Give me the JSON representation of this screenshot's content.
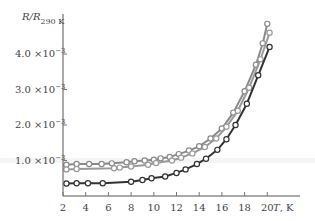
{
  "chart_data": {
    "type": "line",
    "title": "",
    "xlabel": "T, K",
    "ylabel": "R/R290 K",
    "ylabel_main": "R/R",
    "ylabel_sub": "290 K",
    "xlabel_italic": "T",
    "xlabel_unit": ", K",
    "x_ticks": [
      "2",
      "4",
      "6",
      "8",
      "10",
      "12",
      "14",
      "16",
      "18",
      "20"
    ],
    "y_ticks": [
      {
        "value": 1.0,
        "mant": "1.0 ×10",
        "exp": "−3"
      },
      {
        "value": 2.0,
        "mant": "2.0 ×10",
        "exp": "−3"
      },
      {
        "value": 3.0,
        "mant": "3.0 ×10",
        "exp": "−3"
      },
      {
        "value": 4.0,
        "mant": "4.0 ×10",
        "exp": "−3"
      }
    ],
    "xlim": [
      2,
      21
    ],
    "ylim": [
      0,
      5.0
    ],
    "y_scale_note": "values in units of 1e-3",
    "grid": false,
    "series": [
      {
        "name": "sample-1",
        "color": "#8a8a8a",
        "x": [
          2.3,
          3.2,
          4.3,
          5.4,
          6.3,
          7.6,
          8.3,
          9.2,
          10.0,
          10.6,
          11.4,
          12.2,
          13.1,
          14.0,
          15.0,
          16.0,
          17.0,
          18.0,
          19.0,
          19.6,
          20.0
        ],
        "y": [
          0.88,
          0.9,
          0.9,
          0.9,
          0.92,
          0.95,
          0.98,
          1.0,
          1.02,
          1.06,
          1.1,
          1.18,
          1.28,
          1.4,
          1.62,
          1.9,
          2.35,
          2.95,
          3.7,
          4.3,
          4.85
        ]
      },
      {
        "name": "sample-2",
        "color": "#9a9a9a",
        "x": [
          2.3,
          3.2,
          6.5,
          7.0,
          8.0,
          9.5,
          10.2,
          11.6,
          12.4,
          13.4,
          14.5,
          15.5,
          16.4,
          17.4,
          18.4,
          19.4,
          20.2
        ],
        "y": [
          0.75,
          0.76,
          0.78,
          0.8,
          0.83,
          0.88,
          0.93,
          1.0,
          1.08,
          1.2,
          1.38,
          1.62,
          1.95,
          2.4,
          3.05,
          3.85,
          4.6
        ]
      },
      {
        "name": "sample-3",
        "color": "#333333",
        "x": [
          2.3,
          3.2,
          4.2,
          5.5,
          8.0,
          9.0,
          9.8,
          11.0,
          12.0,
          12.8,
          13.8,
          14.6,
          15.6,
          16.4,
          17.2,
          18.2,
          19.2,
          20.2
        ],
        "y": [
          0.35,
          0.36,
          0.36,
          0.36,
          0.4,
          0.45,
          0.5,
          0.55,
          0.65,
          0.75,
          0.9,
          1.05,
          1.3,
          1.6,
          2.0,
          2.6,
          3.4,
          4.2
        ]
      }
    ],
    "highlight_band_y": 1.0
  }
}
